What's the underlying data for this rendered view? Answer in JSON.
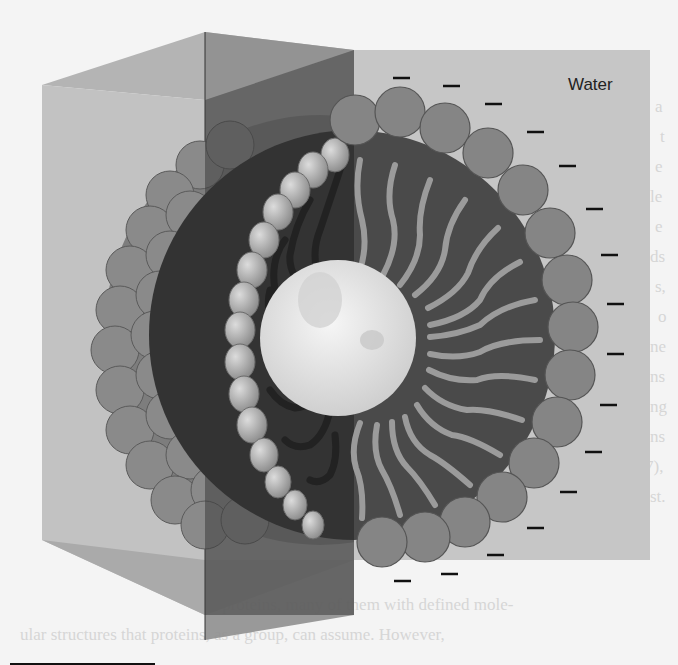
{
  "figure": {
    "labels": {
      "water": "Water"
    },
    "parts": [
      "water-box",
      "hydrophilic-heads",
      "hydrophobic-tails",
      "hydrophobic-core",
      "negative-charges"
    ],
    "charge_symbol": "–",
    "charge_count": 17,
    "colors": {
      "background": "#f4f4f4",
      "water_box": "#c4c4c4",
      "water_box_front_left": "#b8b8b8",
      "water_box_cut": "#8d8d8d",
      "head": "#888888",
      "head_stroke": "#555555",
      "tail": "#9a9a9a",
      "interior": "#4a4a4a",
      "core": "#e6e6e6",
      "charge": "#111111"
    }
  },
  "bleed_through_text": {
    "right_column": [
      "a",
      "t",
      "e",
      "le",
      "e",
      "ds",
      "s,",
      "o",
      "ne",
      "ns",
      "ng",
      "ns",
      "7),",
      "st."
    ],
    "bottom_lines": [
      "lar proteins, many of them with defined mole-",
      "ular structures that proteins, as a group, can assume. However,"
    ]
  }
}
